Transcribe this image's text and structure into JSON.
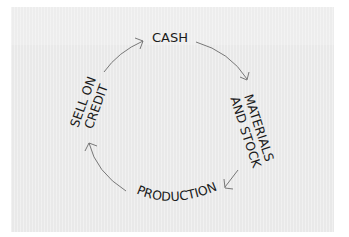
{
  "diagram": {
    "type": "cycle",
    "title": "",
    "background_color": "#e9e9e9",
    "text_color": "#1a1a1a",
    "arrow_color": "#6a6a6a",
    "nodes": [
      {
        "id": "cash",
        "label": "CASH"
      },
      {
        "id": "materials",
        "line1": "MATERIALS",
        "line2": "AND STOCK"
      },
      {
        "id": "production",
        "label": "PRODUCTION"
      },
      {
        "id": "sell",
        "line1": "SELL ON",
        "line2": "CREDIT"
      }
    ],
    "edges": [
      {
        "from": "cash",
        "to": "materials"
      },
      {
        "from": "materials",
        "to": "production"
      },
      {
        "from": "production",
        "to": "sell"
      },
      {
        "from": "sell",
        "to": "cash"
      }
    ]
  }
}
